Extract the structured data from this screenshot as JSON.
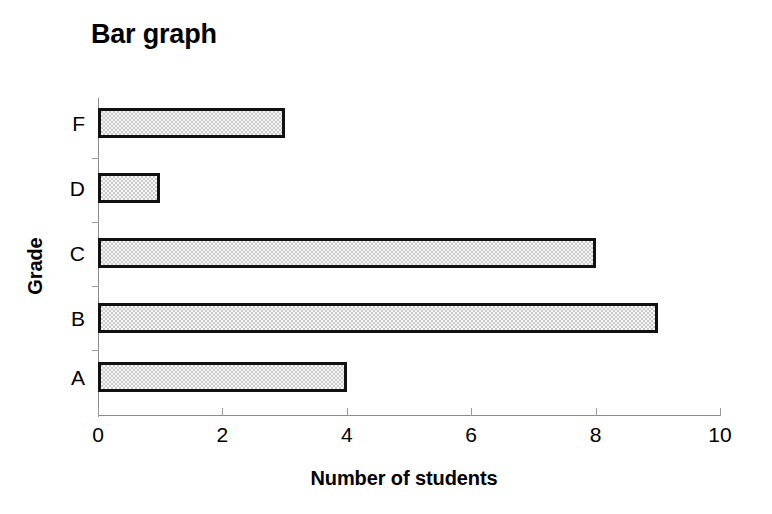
{
  "chart_data": {
    "type": "bar",
    "orientation": "horizontal",
    "title": "Bar graph",
    "xlabel": "Number of students",
    "ylabel": "Grade",
    "categories": [
      "A",
      "B",
      "C",
      "D",
      "F"
    ],
    "values": [
      4,
      9,
      8,
      1,
      3
    ],
    "xlim": [
      0,
      10
    ],
    "xticks": [
      0,
      2,
      4,
      6,
      8,
      10
    ],
    "xtick_labels": [
      "0",
      "2",
      "4",
      "6",
      "8",
      "10"
    ],
    "grid": false,
    "legend": false,
    "bar_fill_color": "#c9c9c9",
    "bar_edge_color": "#111111",
    "axis_color": "#8a8a8a",
    "background_color": "#ffffff",
    "bars": [
      {
        "category": "F",
        "value": 3
      },
      {
        "category": "D",
        "value": 1
      },
      {
        "category": "C",
        "value": 8
      },
      {
        "category": "B",
        "value": 9
      },
      {
        "category": "A",
        "value": 4
      }
    ]
  }
}
